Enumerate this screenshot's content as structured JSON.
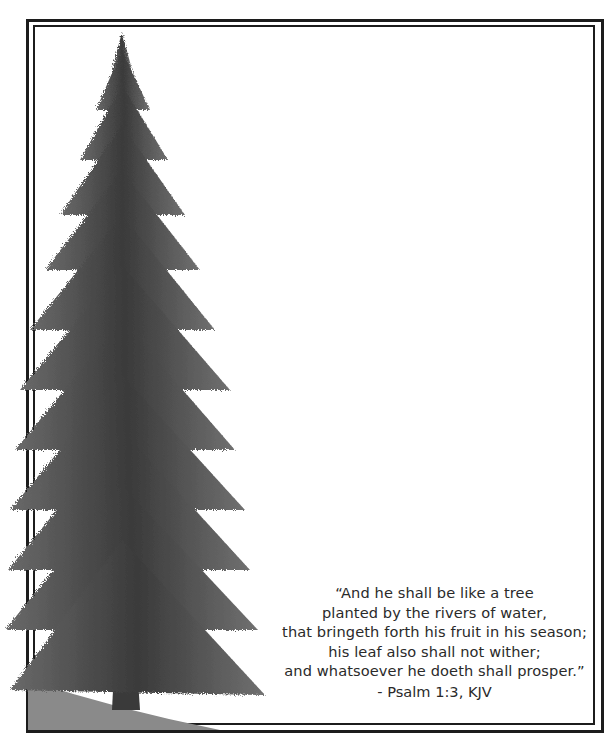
{
  "document": {
    "type": "scripture-print",
    "illustration": "evergreen-tree",
    "colors": {
      "ink": "#1c1c1c",
      "text": "#2a2a2a",
      "foliage": "#4a4a4a",
      "background": "#ffffff"
    }
  },
  "quote": {
    "lines": [
      "“And he shall be like a tree",
      "planted by the rivers of water,",
      "that bringeth forth his fruit in his season;",
      "his leaf also shall not wither;",
      "and whatsoever he doeth shall prosper.”"
    ],
    "citation": "- Psalm 1:3, KJV"
  }
}
